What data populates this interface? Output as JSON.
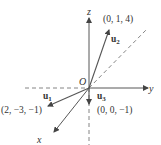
{
  "diagram": {
    "type": "3d-vectors",
    "origin_label": "O",
    "axes": {
      "x": "x",
      "y": "y",
      "z": "z"
    },
    "vectors": [
      {
        "name": "u",
        "subscript": "1",
        "point": "(2, −3, −1)"
      },
      {
        "name": "u",
        "subscript": "2",
        "point": "(0, 1, 4)"
      },
      {
        "name": "u",
        "subscript": "3",
        "point": "(0, 0, −1)"
      }
    ],
    "colors": {
      "axis": "#444444",
      "vector": "#555555",
      "text": "#333333"
    }
  }
}
